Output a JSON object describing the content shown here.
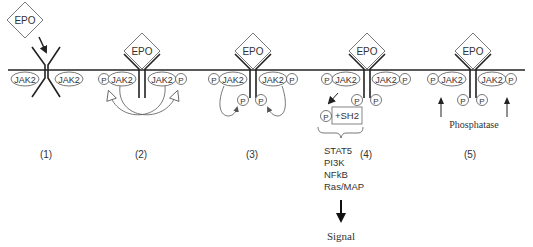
{
  "labels": {
    "epo": "EPO",
    "jak2": "JAK2",
    "p": "P",
    "sh2": "+SH2",
    "phosphatase": "Phosphatase",
    "signal": "Signal"
  },
  "stages": [
    {
      "label": "(1)",
      "description": "EPO binding to receptor"
    },
    {
      "label": "(2)",
      "description": "JAK2 trans-phosphorylation"
    },
    {
      "label": "(3)",
      "description": "Receptor tyrosine phosphorylation"
    },
    {
      "label": "(4)",
      "description": "SH2 docking and downstream signaling"
    },
    {
      "label": "(5)",
      "description": "Phosphatase deactivation"
    }
  ],
  "pathways": [
    "STAT5",
    "PI3K",
    "NFkB",
    "Ras/MAP"
  ],
  "colors": {
    "stroke": "#222222",
    "text": "#333333",
    "background": "#ffffff"
  }
}
